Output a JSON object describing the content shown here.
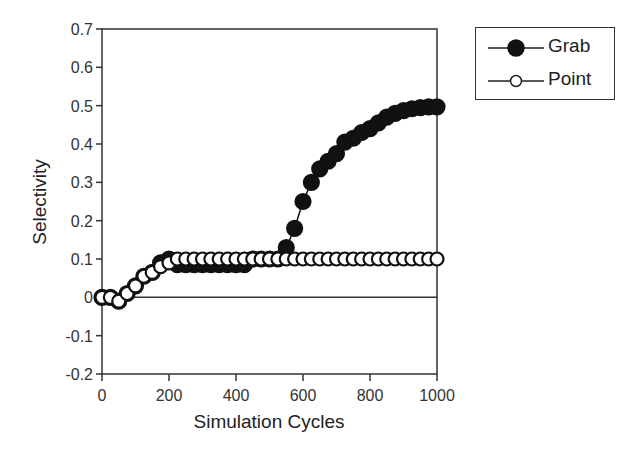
{
  "chart_data": {
    "type": "line",
    "title": "",
    "xlabel": "Simulation Cycles",
    "ylabel": "Selectivity",
    "xlim": [
      0,
      1000
    ],
    "ylim": [
      -0.2,
      0.7
    ],
    "xticks": [
      "0",
      "200",
      "400",
      "600",
      "800",
      "1000"
    ],
    "yticks": [
      "0.7",
      "0.6",
      "0.5",
      "0.4",
      "0.3",
      "0.2",
      "0.1",
      "0",
      "-0.1",
      "-0.2"
    ],
    "grid": false,
    "legend_position": "upper-right-outside",
    "zero_line": true,
    "x": [
      0,
      25,
      50,
      75,
      100,
      125,
      150,
      175,
      200,
      225,
      250,
      275,
      300,
      325,
      350,
      375,
      400,
      425,
      450,
      475,
      500,
      525,
      550,
      575,
      600,
      625,
      650,
      675,
      700,
      725,
      750,
      775,
      800,
      825,
      850,
      875,
      900,
      925,
      950,
      975,
      1000
    ],
    "series": [
      {
        "name": "Grab",
        "marker": "filled-circle",
        "values": [
          0,
          0,
          -0.01,
          0.01,
          0.03,
          0.055,
          0.065,
          0.09,
          0.1,
          0.085,
          0.085,
          0.085,
          0.085,
          0.085,
          0.085,
          0.085,
          0.085,
          0.085,
          0.1,
          0.1,
          0.1,
          0.1,
          0.13,
          0.18,
          0.25,
          0.3,
          0.335,
          0.355,
          0.375,
          0.405,
          0.415,
          0.43,
          0.44,
          0.455,
          0.47,
          0.48,
          0.487,
          0.492,
          0.495,
          0.497,
          0.497
        ]
      },
      {
        "name": "Point",
        "marker": "open-circle",
        "values": [
          0,
          0,
          -0.01,
          0.01,
          0.03,
          0.055,
          0.065,
          0.08,
          0.09,
          0.1,
          0.1,
          0.1,
          0.1,
          0.1,
          0.1,
          0.1,
          0.1,
          0.1,
          0.1,
          0.1,
          0.1,
          0.1,
          0.1,
          0.1,
          0.1,
          0.1,
          0.1,
          0.1,
          0.1,
          0.1,
          0.1,
          0.1,
          0.1,
          0.1,
          0.1,
          0.1,
          0.1,
          0.1,
          0.1,
          0.1,
          0.1
        ]
      }
    ]
  },
  "legend": {
    "items": [
      {
        "label": "Grab"
      },
      {
        "label": "Point"
      }
    ]
  },
  "axes": {
    "xlabel": "Simulation Cycles",
    "ylabel": "Selectivity"
  }
}
